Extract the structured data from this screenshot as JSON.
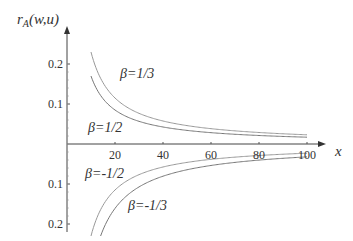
{
  "chart_data": {
    "type": "line",
    "title": "",
    "ylabel": "r_A(w,u)",
    "ylabel_parts": {
      "main": "r",
      "sub": "A",
      "args": "(w,u)"
    },
    "xlabel": "x",
    "xlim": [
      0,
      100
    ],
    "ylim": [
      -0.2,
      0.2
    ],
    "x_ticks": [
      "20",
      "40",
      "60",
      "80",
      "100"
    ],
    "y_ticks_upper": [
      "0.2",
      "0.1"
    ],
    "y_ticks_lower": [
      "0.1",
      "0.2"
    ],
    "grid": false,
    "series": [
      {
        "name": "β=1/3",
        "beta": "1/3",
        "x": [
          10,
          20,
          40,
          60,
          80,
          100
        ],
        "y": [
          0.23,
          0.115,
          0.058,
          0.038,
          0.029,
          0.023
        ]
      },
      {
        "name": "β=1/2",
        "beta": "1/2",
        "x": [
          10,
          20,
          40,
          60,
          80,
          100
        ],
        "y": [
          0.17,
          0.085,
          0.043,
          0.028,
          0.021,
          0.017
        ]
      },
      {
        "name": "β=-1/2",
        "beta": "-1/2",
        "x": [
          10,
          20,
          40,
          60,
          80,
          100
        ],
        "y": [
          -0.23,
          -0.115,
          -0.058,
          -0.038,
          -0.029,
          -0.023
        ]
      },
      {
        "name": "β=-1/3",
        "beta": "-1/3",
        "x": [
          14,
          20,
          40,
          60,
          80,
          100
        ],
        "y": [
          -0.23,
          -0.16,
          -0.08,
          -0.053,
          -0.04,
          -0.032
        ]
      }
    ],
    "annotations": [
      "β=1/3",
      "β=1/2",
      "β=-1/2",
      "β=-1/3"
    ]
  }
}
